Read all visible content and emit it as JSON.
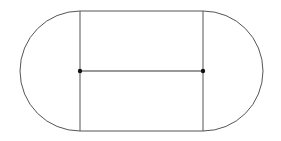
{
  "diagram": {
    "type": "geometric-figure",
    "shape": "stadium (rectangle with semicircular ends)",
    "stroke_color": "#555555",
    "dot_color": "#111111",
    "background": "#ffffff",
    "rectangle": {
      "x1": 80,
      "y1": 11,
      "x2": 203,
      "y2": 131
    },
    "left_semicircle": {
      "cx": 80,
      "cy": 71,
      "r": 60
    },
    "right_semicircle": {
      "cx": 203,
      "cy": 71,
      "r": 60
    },
    "center_segment": {
      "x1": 80,
      "y1": 71,
      "x2": 203,
      "y2": 71
    },
    "points": [
      {
        "name": "left-center",
        "x": 80,
        "y": 71
      },
      {
        "name": "right-center",
        "x": 203,
        "y": 71
      }
    ]
  }
}
